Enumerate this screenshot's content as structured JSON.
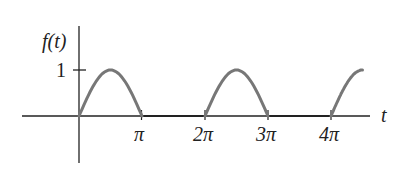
{
  "chart_data": {
    "type": "line",
    "title": "",
    "xlabel": "t",
    "ylabel": "f(t)",
    "function": "half-wave rectified sine: f(t)=sin(t) for sin(t)>=0, else 0",
    "x_ticks": [
      "π",
      "2π",
      "3π",
      "4π"
    ],
    "y_ticks": [
      "1"
    ],
    "x_range": [
      0,
      4.95
    ],
    "y_range": [
      0,
      1
    ],
    "x_units": "multiples of pi",
    "series": [
      {
        "name": "f(t)",
        "segments": [
          {
            "shape": "sine-arch",
            "from": 0,
            "to": 1,
            "peak": 1
          },
          {
            "shape": "zero",
            "from": 1,
            "to": 2
          },
          {
            "shape": "sine-arch",
            "from": 2,
            "to": 3,
            "peak": 1
          },
          {
            "shape": "zero",
            "from": 3,
            "to": 4
          },
          {
            "shape": "sine-rising",
            "from": 4,
            "to": 4.5,
            "end_value": 1
          }
        ]
      }
    ],
    "grid": false,
    "legend": "none"
  },
  "labels": {
    "ylabel": "f(t)",
    "xlabel": "t",
    "y_tick_1": "1",
    "x_tick_1": "π",
    "x_tick_2": "2π",
    "x_tick_3": "3π",
    "x_tick_4": "4π"
  },
  "colors": {
    "curve": "#777777",
    "axes": "#222222"
  }
}
